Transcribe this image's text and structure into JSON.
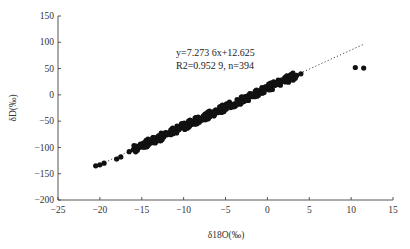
{
  "chart_data": {
    "type": "scatter",
    "title": "",
    "xlabel": "δ18O(‰)",
    "ylabel": "δD(‰)",
    "xlim": [
      -25,
      15
    ],
    "ylim": [
      -200,
      150
    ],
    "x_ticks": [
      -25,
      -20,
      -15,
      -10,
      -5,
      0,
      5,
      10,
      15
    ],
    "y_ticks": [
      150,
      100,
      50,
      0,
      -50,
      -100,
      -150,
      -200
    ],
    "grid": false,
    "legend": null,
    "regression": {
      "slope": 7.2736,
      "intercept": 12.625,
      "r_squared": 0.9529,
      "n": 394,
      "line_style": "dotted",
      "x_range": [
        -20.5,
        11.5
      ]
    },
    "annotations": [
      "y=7.273 6x+12.625",
      "R2=0.952 9, n=394"
    ],
    "series": [
      {
        "name": "samples",
        "marker": "filled-circle",
        "color": "#111111",
        "note": "dense cloud along regression line from x≈-20.5 to x≈4; representative points listed",
        "points": [
          [
            -20.5,
            -135
          ],
          [
            -20.0,
            -133
          ],
          [
            -19.5,
            -130
          ],
          [
            -18.0,
            -122
          ],
          [
            -17.5,
            -118
          ],
          [
            -16.5,
            -108
          ],
          [
            -15.5,
            -100
          ],
          [
            -15.0,
            -97
          ],
          [
            -14.5,
            -94
          ],
          [
            -14.0,
            -90
          ],
          [
            -13.5,
            -87
          ],
          [
            -13.0,
            -83
          ],
          [
            -12.5,
            -80
          ],
          [
            -12.0,
            -76
          ],
          [
            -11.5,
            -72
          ],
          [
            -11.0,
            -69
          ],
          [
            -10.5,
            -65
          ],
          [
            -10.0,
            -61
          ],
          [
            -9.5,
            -58
          ],
          [
            -9.0,
            -54
          ],
          [
            -8.5,
            -50
          ],
          [
            -8.0,
            -47
          ],
          [
            -7.5,
            -43
          ],
          [
            -7.0,
            -40
          ],
          [
            -6.5,
            -36
          ],
          [
            -6.0,
            -32
          ],
          [
            -5.5,
            -29
          ],
          [
            -5.0,
            -25
          ],
          [
            -4.5,
            -21
          ],
          [
            -4.0,
            -18
          ],
          [
            -3.5,
            -14
          ],
          [
            -3.0,
            -10
          ],
          [
            -2.5,
            -7
          ],
          [
            -2.0,
            -3
          ],
          [
            -1.5,
            1
          ],
          [
            -1.0,
            4
          ],
          [
            -0.5,
            8
          ],
          [
            0.0,
            12
          ],
          [
            0.5,
            15
          ],
          [
            1.0,
            19
          ],
          [
            1.5,
            22
          ],
          [
            2.0,
            26
          ],
          [
            2.5,
            30
          ],
          [
            3.0,
            34
          ],
          [
            3.5,
            37
          ],
          [
            4.0,
            40
          ],
          [
            10.5,
            52
          ],
          [
            11.5,
            51
          ]
        ]
      }
    ]
  }
}
